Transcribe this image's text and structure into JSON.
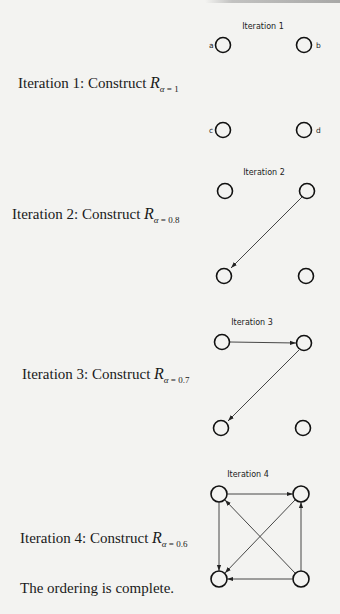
{
  "header": {
    "cut_off_text": ""
  },
  "steps": [
    {
      "label_prefix": "Iteration 1: Construct ",
      "symbol": "R",
      "subscript_var": "α",
      "subscript_rest": " = 1",
      "graph_title": "Iteration 1"
    },
    {
      "label_prefix": "Iteration 2: Construct ",
      "symbol": "R",
      "subscript_var": "α",
      "subscript_rest": " = 0.8",
      "graph_title": "Iteration 2"
    },
    {
      "label_prefix": "Iteration 3: Construct ",
      "symbol": "R",
      "subscript_var": "α",
      "subscript_rest": " = 0.7",
      "graph_title": "Iteration 3"
    },
    {
      "label_prefix": "Iteration 4: Construct ",
      "symbol": "R",
      "subscript_var": "α",
      "subscript_rest": " = 0.6",
      "graph_title": "Iteration 4"
    }
  ],
  "node_labels": {
    "a": "a",
    "b": "b",
    "c": "c",
    "d": "d"
  },
  "graphs": [
    {
      "title": "Iteration 1",
      "edges": []
    },
    {
      "title": "Iteration 2",
      "edges": [
        [
          "b",
          "c"
        ]
      ]
    },
    {
      "title": "Iteration 3",
      "edges": [
        [
          "a",
          "b"
        ],
        [
          "b",
          "c"
        ]
      ]
    },
    {
      "title": "Iteration 4",
      "edges": [
        [
          "a",
          "b"
        ],
        [
          "a",
          "c"
        ],
        [
          "b",
          "c"
        ],
        [
          "d",
          "a"
        ],
        [
          "d",
          "b"
        ],
        [
          "d",
          "c"
        ]
      ]
    }
  ],
  "conclusion": "The ordering is complete."
}
